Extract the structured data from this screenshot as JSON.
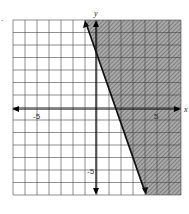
{
  "chart_data": {
    "type": "inequality-graph",
    "title": "",
    "xlabel": "x",
    "ylabel": "y",
    "xlim": [
      -7,
      7
    ],
    "ylim": [
      -7,
      7
    ],
    "grid": true,
    "tick_labels": {
      "x": [
        "-5",
        "5"
      ],
      "y": [
        "-5"
      ]
    },
    "boundary_line": {
      "slope": -3,
      "intercept": 4.5,
      "style": "solid",
      "points": [
        [
          -0.83,
          7
        ],
        [
          3.83,
          -7
        ]
      ]
    },
    "shaded_region": "right of line (3x + y >= 4.5)",
    "shade_color": "#8a8a8a",
    "line_color": "#111111"
  },
  "labels": {
    "x_axis": "x",
    "y_axis": "y",
    "x_neg5": "-5",
    "x_pos5": "5",
    "y_neg5": "-5",
    "corner_mark": "."
  }
}
